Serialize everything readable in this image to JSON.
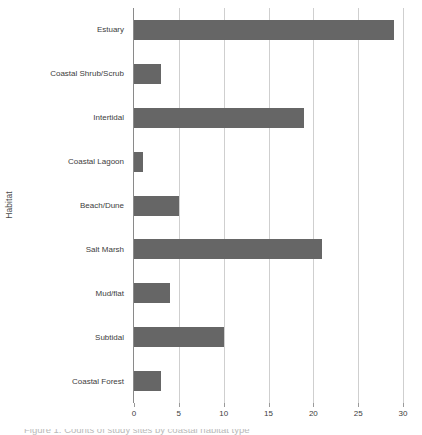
{
  "chart_data": {
    "type": "bar",
    "orientation": "horizontal",
    "title": "",
    "xlabel": "",
    "ylabel": "Habitat",
    "categories": [
      "Estuary",
      "Coastal Shrub/Scrub",
      "Intertidal",
      "Coastal Lagoon",
      "Beach/Dune",
      "Salt Marsh",
      "Mud/flat",
      "Subtidal",
      "Coastal Forest"
    ],
    "values": [
      29,
      3,
      19,
      1,
      5,
      21,
      4,
      10,
      3
    ],
    "xlim": [
      0,
      30
    ],
    "xticks": [
      0,
      5,
      10,
      15,
      20,
      25,
      30
    ],
    "xtick_labels": [
      "0",
      "5",
      "10",
      "15",
      "20",
      "25",
      "30"
    ],
    "grid": "vertical",
    "legend": "none",
    "bar_color": "#666666",
    "gridline_color": "#cfcfcf",
    "axis_color": "#8a8a8a",
    "background_color": "#ffffff"
  },
  "caption": {
    "text": "Figure 1. Counts of study sites by coastal habitat type"
  }
}
